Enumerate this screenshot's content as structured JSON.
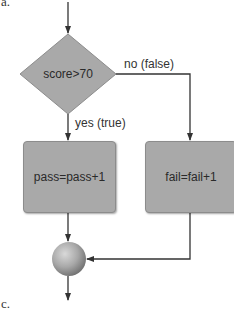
{
  "labels": {
    "top_panel": "a.",
    "bottom_panel": "c."
  },
  "nodes": {
    "decision": {
      "text": "score>70",
      "shape": "diamond"
    },
    "pass_action": {
      "text": "pass=pass+1",
      "shape": "rectangle"
    },
    "fail_action": {
      "text": "fail=fail+1",
      "shape": "rectangle"
    },
    "merge": {
      "text": "",
      "shape": "circle"
    }
  },
  "edges": {
    "true_branch": "yes (true)",
    "false_branch": "no (false)"
  },
  "colors": {
    "node_fill": "#a9a9a9",
    "node_border": "#8c8c8c",
    "arrow": "#333333",
    "background": "#ffffff"
  }
}
